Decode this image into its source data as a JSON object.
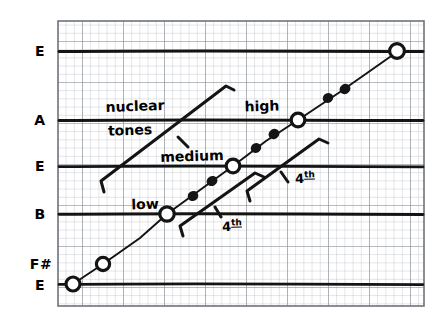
{
  "figure": {
    "background_color": "#ffffff",
    "ink_color": "#111111",
    "grid_minor_color": "#b9bcc4",
    "grid_major_color": "#8d9199",
    "border_color": "#6f737b"
  },
  "axis": {
    "name": "pitch-axis",
    "labels": [
      {
        "text": "E",
        "y": 51
      },
      {
        "text": "A",
        "y": 120
      },
      {
        "text": "E",
        "y": 166
      },
      {
        "text": "B",
        "y": 214
      },
      {
        "text": "F#",
        "y": 264
      },
      {
        "text": "E",
        "y": 284
      }
    ]
  },
  "annotations": [
    {
      "name": "nuclear-tones-line1",
      "text": "nuclear",
      "x": 135,
      "y": 106
    },
    {
      "name": "nuclear-tones-line2",
      "text": "tones",
      "x": 130,
      "y": 130
    },
    {
      "name": "label-high",
      "text": "high",
      "x": 262,
      "y": 106
    },
    {
      "name": "label-medium",
      "text": "medium",
      "x": 192,
      "y": 156
    },
    {
      "name": "label-low",
      "text": "low",
      "x": 145,
      "y": 204
    },
    {
      "name": "label-fourth-lower",
      "text": "4th",
      "x": 232,
      "y": 226
    },
    {
      "name": "label-fourth-upper",
      "text": "4th",
      "x": 305,
      "y": 178
    }
  ],
  "chart_data": {
    "type": "line",
    "title": "nuclear tones",
    "xlabel": "",
    "ylabel": "pitch",
    "grid": true,
    "legend_position": "inline-annotations",
    "y_tick_labels": [
      "E",
      "A",
      "E",
      "B",
      "F#",
      "E"
    ],
    "y_tick_pixels": [
      51,
      120,
      166,
      214,
      264,
      284
    ],
    "series": [
      {
        "name": "nuclear tone trend",
        "marker": "open-circle",
        "note": "main ascending staircase of nuclear tones",
        "points": [
          {
            "x": 73,
            "y": 284,
            "label": "E"
          },
          {
            "x": 103,
            "y": 264,
            "label": "F#"
          },
          {
            "x": 167,
            "y": 214,
            "label": "low / B"
          },
          {
            "x": 233,
            "y": 166,
            "label": "medium / E"
          },
          {
            "x": 298,
            "y": 120,
            "label": "high / A"
          },
          {
            "x": 397,
            "y": 51,
            "label": "E"
          }
        ]
      },
      {
        "name": "intermediate tones",
        "marker": "filled-dot",
        "note": "small filled dots lying on the ascending line between open circles",
        "points": [
          {
            "x": 193,
            "y": 196
          },
          {
            "x": 212,
            "y": 181
          },
          {
            "x": 256,
            "y": 148
          },
          {
            "x": 274,
            "y": 134
          },
          {
            "x": 328,
            "y": 98
          },
          {
            "x": 345,
            "y": 89
          }
        ]
      }
    ],
    "brackets": [
      {
        "name": "nuclear-tones-bracket",
        "from": [
          104,
          185
        ],
        "to": [
          228,
          88
        ],
        "label": "nuclear tones"
      },
      {
        "name": "fourth-bracket-lower",
        "from": [
          183,
          233
        ],
        "to": [
          258,
          176
        ],
        "label": "4th"
      },
      {
        "name": "fourth-bracket-upper",
        "from": [
          252,
          198
        ],
        "to": [
          322,
          142
        ],
        "label": "4th"
      }
    ]
  }
}
